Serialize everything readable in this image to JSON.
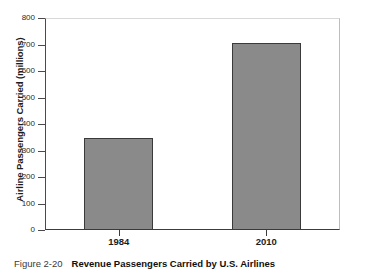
{
  "chart_data": {
    "type": "bar",
    "title": "Revenue Passengers Carried by U.S. Airlines",
    "categories": [
      "1984",
      "2010"
    ],
    "values": [
      347,
      705
    ],
    "xlabel": "",
    "ylabel": "Airline Passengers Carried (millions)",
    "ylim": [
      0,
      800
    ],
    "yticks": [
      0,
      100,
      200,
      300,
      400,
      500,
      600,
      700,
      800
    ],
    "ytick_labels": [
      "0",
      "100",
      "200",
      "300",
      "400",
      "500",
      "600",
      "700",
      "800"
    ],
    "grid": false,
    "legend": null,
    "bar_color": "#8a8a8a",
    "bar_edge_color": "#3a3a3a",
    "axis_color": "#3c3c3c"
  },
  "caption": {
    "figure_number": "Figure 2-20",
    "figure_title": "Revenue Passengers Carried by U.S. Airlines"
  }
}
